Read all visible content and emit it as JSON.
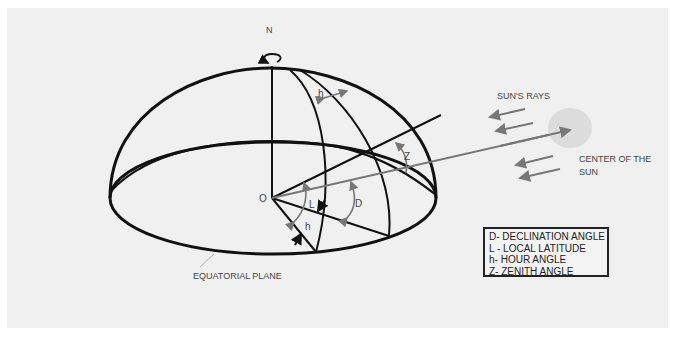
{
  "diagram": {
    "labels": {
      "north": "N",
      "origin": "O",
      "hour_angle_top": "h",
      "hour_angle_bottom": "h",
      "latitude": "L",
      "declination": "D",
      "zenith": "Z",
      "suns_rays": "SUN'S RAYS",
      "sun_center": [
        "CENTER OF THE",
        "SUN"
      ],
      "equatorial_plane": "EQUATORIAL PLANE"
    },
    "legend": [
      "D- DECLINATION ANGLE",
      "L - LOCAL LATITUDE",
      "h- HOUR ANGLE",
      "Z- ZENITH ANGLE"
    ],
    "colors": {
      "lines": "#111111",
      "angle_arrows": "#777777",
      "sun_fill": "#dcdcdc",
      "background": "#f0f0f0"
    }
  }
}
